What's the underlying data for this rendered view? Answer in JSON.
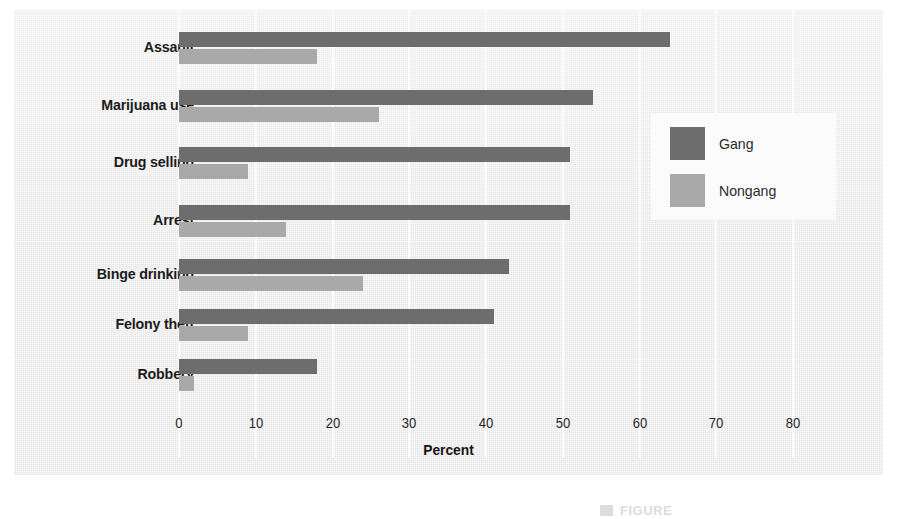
{
  "chart_data": {
    "type": "bar",
    "orientation": "horizontal",
    "title": "",
    "xlabel": "Percent",
    "ylabel": "",
    "xlim": [
      0,
      85
    ],
    "xticks": [
      0,
      10,
      20,
      30,
      40,
      50,
      60,
      70,
      80
    ],
    "grid": true,
    "legend_position": "right",
    "categories": [
      "Assault",
      "Marijuana use",
      "Drug selling",
      "Arrest",
      "Binge drinking",
      "Felony theft",
      "Robbery"
    ],
    "series": [
      {
        "name": "Gang",
        "color": "#6d6d6d",
        "values": [
          64,
          54,
          51,
          51,
          43,
          41,
          18
        ]
      },
      {
        "name": "Nongang",
        "color": "#a9a9a9",
        "values": [
          18,
          26,
          9,
          14,
          24,
          9,
          2
        ]
      }
    ]
  },
  "legend": {
    "items": [
      {
        "label": "Gang"
      },
      {
        "label": "Nongang"
      }
    ]
  },
  "axis": {
    "x_title": "Percent",
    "tick_labels": [
      "0",
      "10",
      "20",
      "30",
      "40",
      "50",
      "60",
      "70",
      "80"
    ]
  },
  "caption": {
    "text": "FIGURE"
  },
  "colors": {
    "gang": "#6d6d6d",
    "nongang": "#a9a9a9",
    "panel_background": "#ececed",
    "gridline": "#fdfdfd",
    "text": "#1b1b1b"
  }
}
